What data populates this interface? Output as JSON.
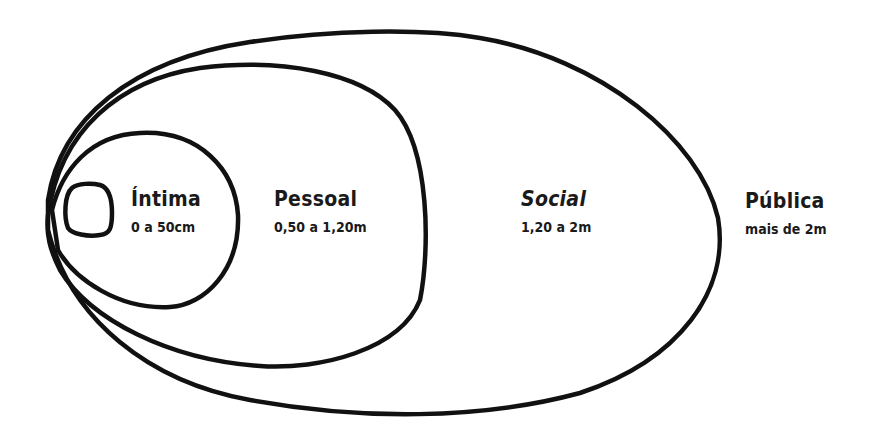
{
  "diagram": {
    "type": "proxemics-zones",
    "stroke_color": "#111111",
    "background": "#ffffff",
    "zones": [
      {
        "id": "intima",
        "title": "Íntima",
        "range": "0 a 50cm"
      },
      {
        "id": "pessoal",
        "title": "Pessoal",
        "range": "0,50 a 1,20m"
      },
      {
        "id": "social",
        "title": "Social",
        "range": "1,20 a 2m"
      },
      {
        "id": "publica",
        "title": "Pública",
        "range": "mais de 2m"
      }
    ]
  }
}
